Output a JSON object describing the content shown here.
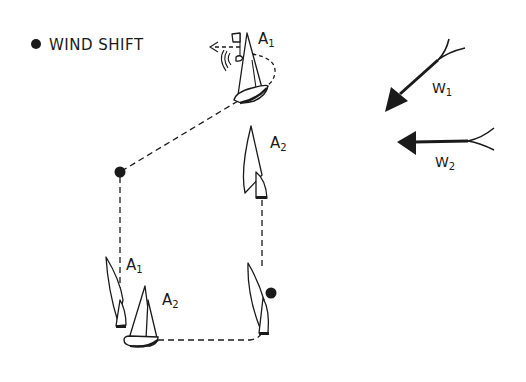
{
  "legend": {
    "marker": "filled-dot",
    "label": "WIND SHIFT"
  },
  "boats": [
    {
      "id": "A1-top",
      "label": "A",
      "sub": "1"
    },
    {
      "id": "A2-top",
      "label": "A",
      "sub": "2"
    },
    {
      "id": "A1-bottom",
      "label": "A",
      "sub": "1"
    },
    {
      "id": "A2-bottom",
      "label": "A",
      "sub": "2"
    }
  ],
  "wind": [
    {
      "id": "W1",
      "label": "W",
      "sub": "1",
      "direction": "from upper-right"
    },
    {
      "id": "W2",
      "label": "W",
      "sub": "2",
      "direction": "from right"
    }
  ],
  "wind_shift_points": [
    {
      "x": 120,
      "y": 172
    },
    {
      "x": 271,
      "y": 293
    }
  ],
  "colors": {
    "ink": "#1a1a1a",
    "background": "#ffffff"
  }
}
